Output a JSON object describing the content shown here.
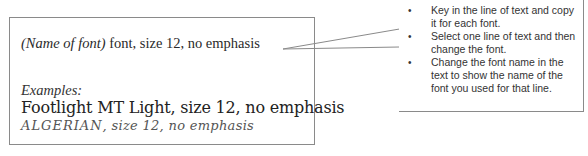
{
  "main_box": {
    "template_line": {
      "placeholder": "(Name of font)",
      "rest": " font, size 12, no emphasis"
    },
    "examples_label": "Examples:",
    "examples": [
      "Footlight MT Light, size 12, no emphasis",
      {
        "font_name": "ALGERIAN",
        "rest": ", size 12, no emphasis"
      }
    ]
  },
  "callout": {
    "bullet_glyph": "•",
    "items": [
      "Key in the line of text and copy it for each font.",
      "Select one line of text and then change the font.",
      "Change the font name in the text to show the name of the font you used for that line."
    ]
  },
  "colors": {
    "border": "#8a8a8a",
    "text": "#2a2a2a",
    "background": "#ffffff"
  }
}
